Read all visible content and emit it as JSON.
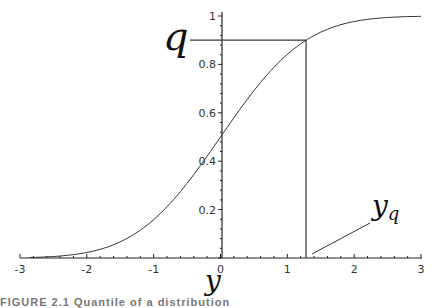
{
  "chart_data": {
    "type": "line",
    "title": "",
    "xlabel": "y",
    "ylabel": "",
    "xlim": [
      -3,
      3
    ],
    "ylim": [
      0,
      1
    ],
    "grid": false,
    "x_ticks": [
      "-3",
      "-2",
      "-1",
      "0",
      "1",
      "2",
      "3"
    ],
    "y_ticks": [
      "0.2",
      "0.4",
      "0.6",
      "0.8",
      "1"
    ],
    "series": [
      {
        "name": "standard normal CDF",
        "function": "Phi(y)",
        "x": [
          -3,
          -2.5,
          -2,
          -1.5,
          -1,
          -0.5,
          0,
          0.5,
          1,
          1.28,
          1.5,
          2,
          2.5,
          3
        ],
        "values": [
          0.001,
          0.006,
          0.023,
          0.067,
          0.159,
          0.309,
          0.5,
          0.691,
          0.841,
          0.9,
          0.933,
          0.977,
          0.994,
          0.999
        ]
      }
    ],
    "annotations": [
      {
        "label": "q",
        "value": 0.9,
        "type": "horizontal-line",
        "from_x": -0.05,
        "to_x": 1.28
      },
      {
        "label": "y_q",
        "value": 1.28,
        "type": "vertical-line",
        "from_y": 0,
        "to_y": 0.9
      }
    ]
  },
  "labels": {
    "q": "q",
    "y_axis_var": "y",
    "yq_main": "y",
    "yq_sub": "q",
    "caption": "FIGURE 2.1  Quantile of a distribution"
  }
}
